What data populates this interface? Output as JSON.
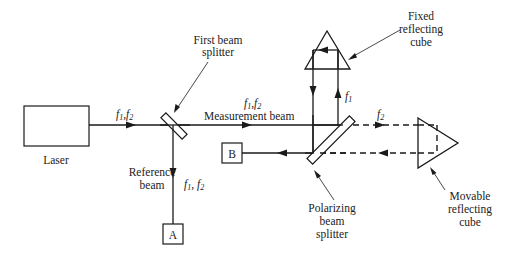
{
  "diagram": {
    "components": {
      "laser": {
        "label": "Laser"
      },
      "first_beam_splitter": {
        "label_line1": "First beam",
        "label_line2": "splitter"
      },
      "polarizing_beam_splitter": {
        "label_line1": "Polarizing",
        "label_line2": "beam",
        "label_line3": "splitter"
      },
      "fixed_cube": {
        "label_line1": "Fixed",
        "label_line2": "reflecting",
        "label_line3": "cube"
      },
      "movable_cube": {
        "label_line1": "Movable",
        "label_line2": "reflecting",
        "label_line3": "cube"
      },
      "detector_a": {
        "label": "A"
      },
      "detector_b": {
        "label": "B"
      }
    },
    "beams": {
      "laser_output": {
        "f": "f",
        "s1": "1",
        "sep": ",",
        "s2": "2"
      },
      "measurement": {
        "f": "f",
        "s1": "1",
        "sep": ",",
        "s2": "2",
        "label": "Measurement beam"
      },
      "reference": {
        "label_line1": "Reference",
        "label_line2": "beam",
        "f": "f",
        "s1": "1",
        "sep": ", ",
        "s2": "2"
      },
      "fixed_path": {
        "f": "f",
        "s1": "1"
      },
      "movable_path": {
        "f": "f",
        "s2": "2"
      }
    }
  }
}
